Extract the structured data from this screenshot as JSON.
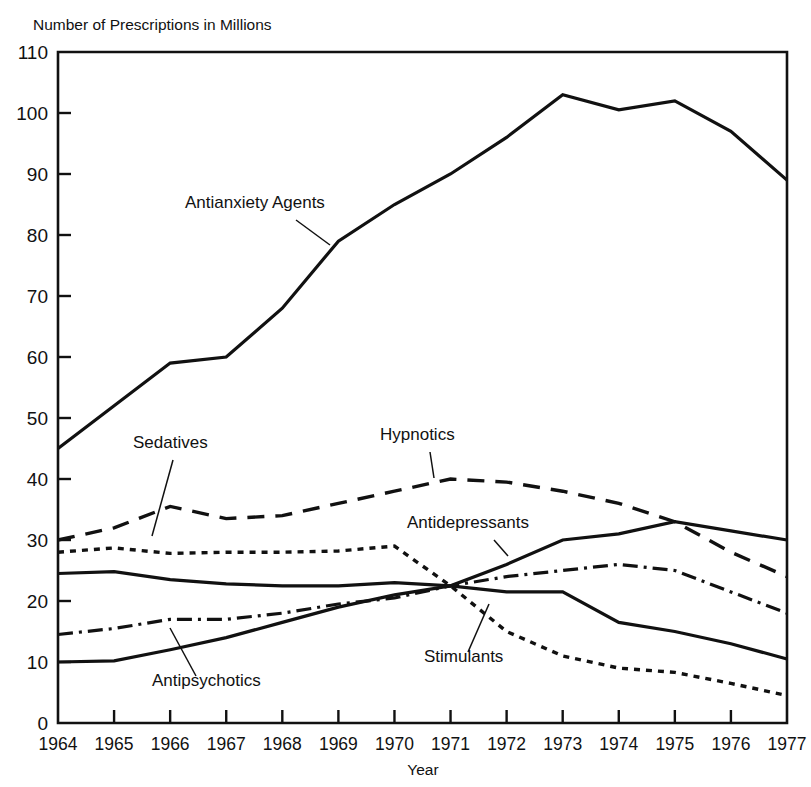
{
  "chart_data": {
    "type": "line",
    "title": "Number of Prescriptions in Millions",
    "xlabel": "Year",
    "ylabel": "",
    "ylim": [
      0,
      110
    ],
    "ytick_step": 10,
    "yticks": [
      "0",
      "10",
      "20",
      "30",
      "40",
      "50",
      "60",
      "70",
      "80",
      "90",
      "100",
      "110"
    ],
    "grid": false,
    "legend_position": "inline-annotations",
    "categories": [
      "1964",
      "1965",
      "1966",
      "1967",
      "1968",
      "1969",
      "1970",
      "1971",
      "1972",
      "1973",
      "1974",
      "1975",
      "1976",
      "1977"
    ],
    "x": [
      1964,
      1965,
      1966,
      1967,
      1968,
      1969,
      1970,
      1971,
      1972,
      1973,
      1974,
      1975,
      1976,
      1977
    ],
    "series": [
      {
        "name": "Antianxiety Agents",
        "style": "solid",
        "values": [
          45,
          52,
          59,
          60,
          68,
          79,
          85,
          90,
          96,
          103,
          100.5,
          102,
          97,
          89
        ]
      },
      {
        "name": "Hypnotics",
        "style": "long-dash",
        "values": [
          30,
          32,
          35.5,
          33.5,
          34,
          36,
          38,
          40,
          39.5,
          38,
          36,
          33,
          28,
          24
        ]
      },
      {
        "name": "Stimulants",
        "style": "fine-dot",
        "values": [
          28,
          28.7,
          27.8,
          28,
          28,
          28.2,
          29,
          22.5,
          15,
          11,
          9,
          8.3,
          6.5,
          4.5
        ]
      },
      {
        "name": "Antidepressants",
        "style": "solid",
        "values": [
          24.5,
          24.8,
          23.5,
          22.8,
          22.5,
          22.5,
          23,
          22.5,
          26,
          30,
          31,
          33,
          31.5,
          30
        ]
      },
      {
        "name": "Antipsychotics",
        "style": "dash-dot",
        "values": [
          14.5,
          15.5,
          17,
          17,
          18,
          19.5,
          20.5,
          22.5,
          24,
          25,
          26,
          25,
          21.5,
          18
        ]
      },
      {
        "name": "Sedatives",
        "style": "solid",
        "values": [
          10,
          10.2,
          12,
          14,
          16.5,
          19,
          21,
          22.5,
          21.5,
          21.5,
          16.5,
          15,
          13,
          10.5
        ]
      }
    ],
    "annotations": [
      {
        "text": "Antianxiety Agents",
        "label_x": 185,
        "label_y": 208
      },
      {
        "text": "Sedatives",
        "label_x": 133,
        "label_y": 448
      },
      {
        "text": "Hypnotics",
        "label_x": 380,
        "label_y": 440
      },
      {
        "text": "Antidepressants",
        "label_x": 407,
        "label_y": 528
      },
      {
        "text": "Antipsychotics",
        "label_x": 152,
        "label_y": 686
      },
      {
        "text": "Stimulants",
        "label_x": 424,
        "label_y": 662
      }
    ]
  },
  "colors": {
    "ink": "#111111",
    "background": "#ffffff"
  }
}
